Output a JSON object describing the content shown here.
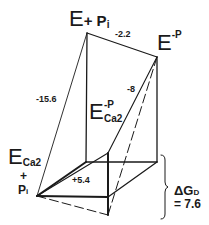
{
  "diagram": {
    "type": "thermodynamic-box-diagram",
    "states": {
      "top_left": {
        "main": "E",
        "suffix": "+ P",
        "sub": "i"
      },
      "top_right": {
        "main": "E",
        "sup": "-P"
      },
      "middle": {
        "main": "E",
        "sup": "-P",
        "sub": "Ca2"
      },
      "bottom_left": {
        "main": "E",
        "sub": "Ca2",
        "plus": "+",
        "pi": "P",
        "pi_sub": "i"
      }
    },
    "edge_values": {
      "top_edge": "-2.2",
      "left_diagonal": "-15.6",
      "right_diagonal": "-8",
      "base_face": "+5.4"
    },
    "bracket": {
      "label_main": "ΔG",
      "label_sub": "D",
      "value": "= 7.6"
    },
    "colors": {
      "ink": "#1a1a1a",
      "background": "#ffffff"
    }
  }
}
